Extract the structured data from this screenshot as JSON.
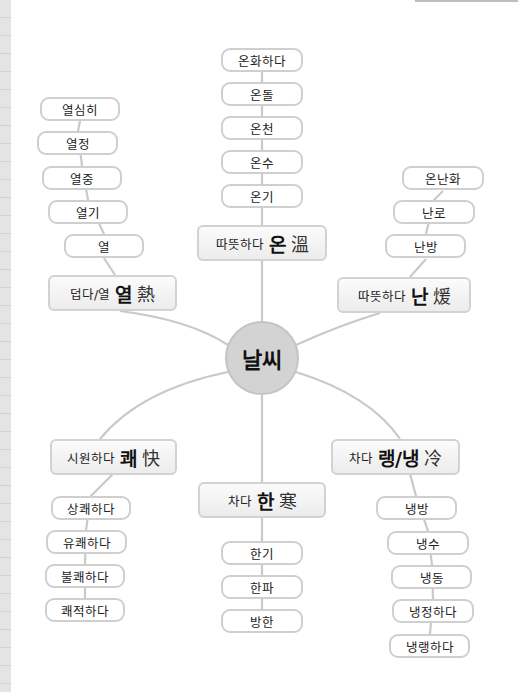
{
  "center": {
    "label": "날씨"
  },
  "hubs": {
    "on": {
      "meaning": "따뜻하다",
      "syllable": "온",
      "hanja": "溫"
    },
    "yeol": {
      "meaning": "덥다/열",
      "syllable": "열",
      "hanja": "熱"
    },
    "nan": {
      "meaning": "따뜻하다",
      "syllable": "난",
      "hanja": "煖"
    },
    "kwae": {
      "meaning": "시원하다",
      "syllable": "쾌",
      "hanja": "快"
    },
    "han": {
      "meaning": "차다",
      "syllable": "한",
      "hanja": "寒"
    },
    "naeng": {
      "meaning": "차다",
      "syllable": "랭/냉",
      "hanja": "冷"
    }
  },
  "leaves": {
    "on": [
      "온화하다",
      "온돌",
      "온천",
      "온수",
      "온기"
    ],
    "yeol": [
      "열심히",
      "열정",
      "열중",
      "열기",
      "열"
    ],
    "nan": [
      "온난화",
      "난로",
      "난방"
    ],
    "kwae": [
      "상쾌하다",
      "유쾌하다",
      "불쾌하다",
      "쾌적하다"
    ],
    "han": [
      "한기",
      "한파",
      "방한"
    ],
    "naeng": [
      "냉방",
      "냉수",
      "냉동",
      "냉정하다",
      "냉랭하다"
    ]
  },
  "colors": {
    "connector": "#c9c9c9",
    "node_border": "#cfcfcf",
    "center_fill": "#d3d3d3"
  }
}
